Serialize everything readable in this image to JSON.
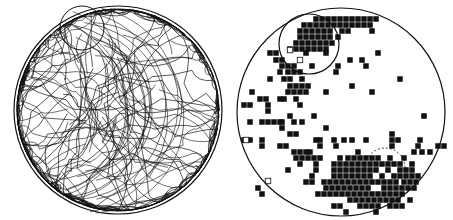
{
  "figure": {
    "width": 453,
    "height": 220,
    "ink_color": "#111111",
    "background": "#ffffff"
  },
  "left_panel": {
    "name": "trajectory-plot",
    "arena": {
      "cx": 118,
      "cy": 110,
      "r": 104
    },
    "platform_circle": {
      "cx": 82,
      "cy": 28,
      "r": 22
    },
    "trajectory_seed": 7,
    "trajectory_count": 90,
    "density_center": {
      "cx": 88,
      "cy": 80
    }
  },
  "right_panel": {
    "name": "occupancy-grid-plot",
    "arena": {
      "cx": 341,
      "cy": 112,
      "r": 104
    },
    "platform_circle": {
      "cx": 309,
      "cy": 44,
      "r": 30
    },
    "arc_marker": {
      "cx": 385,
      "cy": 168,
      "r": 20
    },
    "cell_size": 5.5,
    "filled_cells": [
      [
        316,
        19
      ],
      [
        322,
        19
      ],
      [
        328,
        19
      ],
      [
        334,
        19
      ],
      [
        340,
        19
      ],
      [
        346,
        19
      ],
      [
        352,
        19
      ],
      [
        358,
        19
      ],
      [
        364,
        19
      ],
      [
        370,
        19
      ],
      [
        376,
        19
      ],
      [
        304,
        25
      ],
      [
        310,
        25
      ],
      [
        316,
        25
      ],
      [
        322,
        25
      ],
      [
        328,
        25
      ],
      [
        334,
        25
      ],
      [
        340,
        25
      ],
      [
        346,
        25
      ],
      [
        352,
        25
      ],
      [
        358,
        25
      ],
      [
        364,
        25
      ],
      [
        370,
        25
      ],
      [
        300,
        31
      ],
      [
        306,
        31
      ],
      [
        312,
        31
      ],
      [
        318,
        31
      ],
      [
        324,
        31
      ],
      [
        330,
        31
      ],
      [
        342,
        31
      ],
      [
        348,
        31
      ],
      [
        372,
        31
      ],
      [
        300,
        37
      ],
      [
        306,
        37
      ],
      [
        312,
        37
      ],
      [
        318,
        37
      ],
      [
        324,
        37
      ],
      [
        330,
        37
      ],
      [
        338,
        37
      ],
      [
        296,
        43
      ],
      [
        302,
        43
      ],
      [
        308,
        43
      ],
      [
        314,
        43
      ],
      [
        320,
        43
      ],
      [
        326,
        43
      ],
      [
        332,
        43
      ],
      [
        290,
        49
      ],
      [
        296,
        49
      ],
      [
        302,
        49
      ],
      [
        308,
        49
      ],
      [
        314,
        49
      ],
      [
        320,
        49
      ],
      [
        326,
        49
      ],
      [
        270,
        53
      ],
      [
        276,
        53
      ],
      [
        306,
        53
      ],
      [
        326,
        53
      ],
      [
        378,
        53
      ],
      [
        276,
        60
      ],
      [
        282,
        60
      ],
      [
        350,
        60
      ],
      [
        362,
        60
      ],
      [
        282,
        66
      ],
      [
        288,
        66
      ],
      [
        294,
        66
      ],
      [
        312,
        66
      ],
      [
        338,
        66
      ],
      [
        366,
        66
      ],
      [
        280,
        72
      ],
      [
        288,
        72
      ],
      [
        294,
        72
      ],
      [
        300,
        72
      ],
      [
        336,
        72
      ],
      [
        270,
        79
      ],
      [
        284,
        79
      ],
      [
        290,
        79
      ],
      [
        302,
        79
      ],
      [
        400,
        79
      ],
      [
        290,
        86
      ],
      [
        296,
        86
      ],
      [
        302,
        86
      ],
      [
        308,
        86
      ],
      [
        352,
        86
      ],
      [
        252,
        92
      ],
      [
        288,
        92
      ],
      [
        294,
        92
      ],
      [
        300,
        92
      ],
      [
        306,
        92
      ],
      [
        326,
        92
      ],
      [
        372,
        92
      ],
      [
        260,
        99
      ],
      [
        266,
        99
      ],
      [
        280,
        99
      ],
      [
        284,
        99
      ],
      [
        296,
        99
      ],
      [
        244,
        105
      ],
      [
        250,
        105
      ],
      [
        268,
        105
      ],
      [
        300,
        105
      ],
      [
        268,
        111
      ],
      [
        290,
        116
      ],
      [
        314,
        116
      ],
      [
        424,
        116
      ],
      [
        282,
        122
      ],
      [
        302,
        122
      ],
      [
        250,
        122
      ],
      [
        262,
        122
      ],
      [
        268,
        122
      ],
      [
        274,
        122
      ],
      [
        280,
        122
      ],
      [
        294,
        122
      ],
      [
        282,
        128
      ],
      [
        326,
        128
      ],
      [
        290,
        134
      ],
      [
        296,
        134
      ],
      [
        392,
        134
      ],
      [
        244,
        140
      ],
      [
        250,
        140
      ],
      [
        262,
        140
      ],
      [
        316,
        140
      ],
      [
        320,
        140
      ],
      [
        334,
        140
      ],
      [
        344,
        140
      ],
      [
        352,
        140
      ],
      [
        366,
        140
      ],
      [
        392,
        140
      ],
      [
        398,
        140
      ],
      [
        420,
        140
      ],
      [
        262,
        146
      ],
      [
        280,
        146
      ],
      [
        286,
        146
      ],
      [
        320,
        146
      ],
      [
        336,
        146
      ],
      [
        392,
        146
      ],
      [
        418,
        146
      ],
      [
        438,
        146
      ],
      [
        444,
        146
      ],
      [
        294,
        152
      ],
      [
        300,
        152
      ],
      [
        306,
        152
      ],
      [
        310,
        152
      ],
      [
        358,
        152
      ],
      [
        414,
        152
      ],
      [
        422,
        152
      ],
      [
        430,
        152
      ],
      [
        296,
        158
      ],
      [
        302,
        158
      ],
      [
        308,
        158
      ],
      [
        314,
        158
      ],
      [
        320,
        158
      ],
      [
        340,
        158
      ],
      [
        348,
        158
      ],
      [
        354,
        158
      ],
      [
        360,
        158
      ],
      [
        366,
        158
      ],
      [
        372,
        158
      ],
      [
        378,
        158
      ],
      [
        390,
        158
      ],
      [
        404,
        158
      ],
      [
        300,
        164
      ],
      [
        316,
        164
      ],
      [
        334,
        164
      ],
      [
        340,
        164
      ],
      [
        346,
        164
      ],
      [
        352,
        164
      ],
      [
        358,
        164
      ],
      [
        364,
        164
      ],
      [
        370,
        164
      ],
      [
        376,
        164
      ],
      [
        382,
        164
      ],
      [
        388,
        164
      ],
      [
        394,
        164
      ],
      [
        400,
        164
      ],
      [
        412,
        164
      ],
      [
        288,
        170
      ],
      [
        316,
        170
      ],
      [
        334,
        170
      ],
      [
        340,
        170
      ],
      [
        346,
        170
      ],
      [
        352,
        170
      ],
      [
        358,
        170
      ],
      [
        364,
        170
      ],
      [
        370,
        170
      ],
      [
        376,
        170
      ],
      [
        388,
        170
      ],
      [
        400,
        170
      ],
      [
        406,
        170
      ],
      [
        412,
        170
      ],
      [
        312,
        176
      ],
      [
        334,
        176
      ],
      [
        340,
        176
      ],
      [
        346,
        176
      ],
      [
        352,
        176
      ],
      [
        358,
        176
      ],
      [
        364,
        176
      ],
      [
        370,
        176
      ],
      [
        382,
        176
      ],
      [
        394,
        176
      ],
      [
        400,
        176
      ],
      [
        406,
        176
      ],
      [
        412,
        176
      ],
      [
        418,
        176
      ],
      [
        306,
        182
      ],
      [
        312,
        182
      ],
      [
        324,
        182
      ],
      [
        330,
        182
      ],
      [
        336,
        182
      ],
      [
        342,
        182
      ],
      [
        348,
        182
      ],
      [
        354,
        182
      ],
      [
        360,
        182
      ],
      [
        366,
        182
      ],
      [
        372,
        182
      ],
      [
        378,
        182
      ],
      [
        384,
        182
      ],
      [
        390,
        182
      ],
      [
        396,
        182
      ],
      [
        404,
        182
      ],
      [
        410,
        182
      ],
      [
        416,
        182
      ],
      [
        258,
        188
      ],
      [
        326,
        188
      ],
      [
        332,
        188
      ],
      [
        338,
        188
      ],
      [
        344,
        188
      ],
      [
        350,
        188
      ],
      [
        356,
        188
      ],
      [
        362,
        188
      ],
      [
        368,
        188
      ],
      [
        384,
        188
      ],
      [
        390,
        188
      ],
      [
        396,
        188
      ],
      [
        402,
        188
      ],
      [
        408,
        188
      ],
      [
        414,
        188
      ],
      [
        262,
        194
      ],
      [
        318,
        194
      ],
      [
        324,
        194
      ],
      [
        330,
        194
      ],
      [
        336,
        194
      ],
      [
        342,
        194
      ],
      [
        348,
        194
      ],
      [
        354,
        194
      ],
      [
        360,
        194
      ],
      [
        366,
        194
      ],
      [
        372,
        194
      ],
      [
        378,
        194
      ],
      [
        384,
        194
      ],
      [
        390,
        194
      ],
      [
        396,
        194
      ],
      [
        402,
        194
      ],
      [
        350,
        200
      ],
      [
        356,
        200
      ],
      [
        362,
        200
      ],
      [
        368,
        200
      ],
      [
        374,
        200
      ],
      [
        380,
        200
      ],
      [
        386,
        200
      ],
      [
        392,
        200
      ],
      [
        398,
        200
      ],
      [
        410,
        200
      ],
      [
        334,
        206
      ],
      [
        340,
        206
      ],
      [
        360,
        206
      ],
      [
        366,
        206
      ],
      [
        372,
        206
      ],
      [
        378,
        206
      ],
      [
        390,
        206
      ],
      [
        396,
        206
      ],
      [
        402,
        206
      ],
      [
        346,
        212
      ],
      [
        376,
        212
      ]
    ],
    "open_cells": [
      [
        290,
        50
      ],
      [
        300,
        60
      ],
      [
        246,
        140
      ],
      [
        268,
        181
      ]
    ]
  }
}
